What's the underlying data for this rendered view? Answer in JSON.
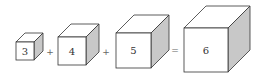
{
  "diagram": {
    "equation": "3³ + 4³ + 5³ = 6³",
    "colors": {
      "stroke": "#333333",
      "front": "#ffffff",
      "top": "#ffffff",
      "side": "#c8c8c8"
    },
    "cubes": [
      {
        "label": "3",
        "x": 16,
        "y": 42,
        "s": 18,
        "d": 9
      },
      {
        "label": "4",
        "x": 58,
        "y": 37,
        "s": 28,
        "d": 13
      },
      {
        "label": "5",
        "x": 116,
        "y": 33,
        "s": 35,
        "d": 18
      },
      {
        "label": "6",
        "x": 184,
        "y": 28,
        "s": 44,
        "d": 22
      }
    ],
    "operators": [
      {
        "symbol": "+",
        "x": 50,
        "y": 55
      },
      {
        "symbol": "+",
        "x": 106,
        "y": 55
      },
      {
        "symbol": "=",
        "x": 175,
        "y": 53
      }
    ]
  }
}
